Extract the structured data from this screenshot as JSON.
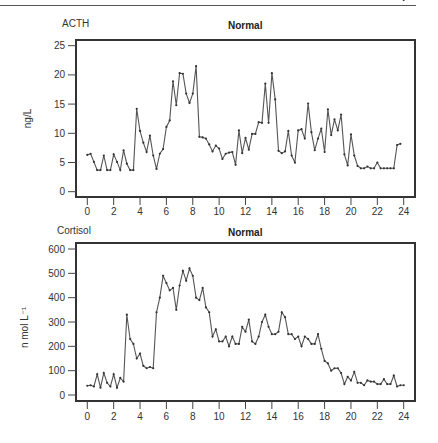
{
  "chart_data": [
    {
      "type": "line",
      "series_label": "ACTH",
      "title": "Normal",
      "xlabel": "",
      "ylabel": "ng/L",
      "xlim": [
        0,
        24
      ],
      "ylim": [
        0,
        25
      ],
      "xticks": [
        0,
        2,
        4,
        6,
        8,
        10,
        12,
        14,
        16,
        18,
        20,
        22,
        24
      ],
      "yticks": [
        0,
        5,
        10,
        15,
        20,
        25
      ],
      "grid": false,
      "legend": null,
      "x": [
        0.0,
        0.25,
        0.5,
        0.75,
        1.0,
        1.25,
        1.5,
        1.75,
        2.0,
        2.25,
        2.5,
        2.75,
        3.0,
        3.25,
        3.5,
        3.75,
        4.0,
        4.25,
        4.5,
        4.75,
        5.0,
        5.25,
        5.5,
        5.75,
        6.0,
        6.25,
        6.5,
        6.75,
        7.0,
        7.25,
        7.5,
        7.75,
        8.0,
        8.25,
        8.5,
        8.75,
        9.0,
        9.25,
        9.5,
        9.75,
        10.0,
        10.25,
        10.5,
        10.75,
        11.0,
        11.25,
        11.5,
        11.75,
        12.0,
        12.25,
        12.5,
        12.75,
        13.0,
        13.25,
        13.5,
        13.75,
        14.0,
        14.25,
        14.5,
        14.75,
        15.0,
        15.25,
        15.5,
        15.75,
        16.0,
        16.25,
        16.5,
        16.75,
        17.0,
        17.25,
        17.5,
        17.75,
        18.0,
        18.25,
        18.5,
        18.75,
        19.0,
        19.25,
        19.5,
        19.75,
        20.0,
        20.25,
        20.5,
        20.75,
        21.0,
        21.25,
        21.5,
        21.75,
        22.0,
        22.25,
        22.5,
        22.75,
        23.0,
        23.25,
        23.5,
        23.75,
        24.0
      ],
      "values": [
        6.3,
        6.5,
        5.1,
        3.7,
        3.7,
        6.2,
        3.7,
        3.7,
        6.4,
        5.1,
        3.7,
        7.1,
        4.8,
        3.7,
        3.7,
        14.2,
        10.4,
        8.4,
        6.8,
        9.6,
        6.2,
        3.9,
        6.5,
        7.3,
        11.1,
        12.2,
        18.9,
        14.8,
        20.3,
        20.2,
        16.8,
        15.2,
        16.8,
        21.5,
        9.4,
        9.3,
        9.1,
        8.1,
        6.9,
        7.9,
        7.4,
        5.6,
        6.5,
        6.7,
        6.8,
        4.6,
        10.5,
        6.6,
        9.2,
        7.2,
        9.9,
        9.9,
        11.9,
        11.8,
        18.5,
        11.8,
        20.3,
        15.8,
        7.0,
        6.6,
        6.9,
        10.4,
        6.2,
        5.0,
        10.5,
        10.7,
        9.1,
        15.1,
        10.2,
        7.1,
        9.1,
        10.8,
        6.8,
        14.1,
        9.7,
        12.4,
        10.5,
        13.2,
        6.4,
        4.5,
        9.8,
        6.2,
        4.4,
        4.0,
        4.0,
        4.3,
        4.0,
        4.0,
        5.0,
        4.0,
        4.0,
        4.0,
        4.0,
        4.0,
        8.0,
        8.2
      ]
    },
    {
      "type": "line",
      "series_label": "Cortisol",
      "title": "Normal",
      "xlabel": "",
      "ylabel": "n mol L⁻¹",
      "xlim": [
        0,
        24
      ],
      "ylim": [
        0,
        600
      ],
      "xticks": [
        0,
        2,
        4,
        6,
        8,
        10,
        12,
        14,
        16,
        18,
        20,
        22,
        24
      ],
      "yticks": [
        0,
        100,
        200,
        300,
        400,
        500,
        600
      ],
      "grid": false,
      "legend": null,
      "x": [
        0.0,
        0.25,
        0.5,
        0.75,
        1.0,
        1.25,
        1.5,
        1.75,
        2.0,
        2.25,
        2.5,
        2.75,
        3.0,
        3.25,
        3.5,
        3.75,
        4.0,
        4.25,
        4.5,
        4.75,
        5.0,
        5.25,
        5.5,
        5.75,
        6.0,
        6.25,
        6.5,
        6.75,
        7.0,
        7.25,
        7.5,
        7.75,
        8.0,
        8.25,
        8.5,
        8.75,
        9.0,
        9.25,
        9.5,
        9.75,
        10.0,
        10.25,
        10.5,
        10.75,
        11.0,
        11.25,
        11.5,
        11.75,
        12.0,
        12.25,
        12.5,
        12.75,
        13.0,
        13.25,
        13.5,
        13.75,
        14.0,
        14.25,
        14.5,
        14.75,
        15.0,
        15.25,
        15.5,
        15.75,
        16.0,
        16.25,
        16.5,
        16.75,
        17.0,
        17.25,
        17.5,
        17.75,
        18.0,
        18.25,
        18.5,
        18.75,
        19.0,
        19.25,
        19.5,
        19.75,
        20.0,
        20.25,
        20.5,
        20.75,
        21.0,
        21.25,
        21.5,
        21.75,
        22.0,
        22.25,
        22.5,
        22.75,
        23.0,
        23.25,
        23.5,
        23.75,
        24.0
      ],
      "values": [
        38,
        40,
        35,
        85,
        30,
        90,
        50,
        35,
        85,
        30,
        70,
        55,
        330,
        230,
        210,
        150,
        170,
        120,
        110,
        115,
        110,
        340,
        400,
        490,
        460,
        430,
        440,
        350,
        450,
        510,
        470,
        520,
        490,
        400,
        390,
        440,
        360,
        340,
        240,
        270,
        220,
        220,
        240,
        200,
        240,
        210,
        210,
        280,
        260,
        310,
        220,
        210,
        240,
        300,
        330,
        280,
        250,
        250,
        260,
        340,
        320,
        250,
        250,
        230,
        240,
        200,
        240,
        230,
        210,
        210,
        250,
        190,
        140,
        130,
        100,
        110,
        110,
        90,
        45,
        75,
        60,
        95,
        50,
        50,
        40,
        60,
        55,
        55,
        45,
        45,
        65,
        45,
        45,
        80,
        35,
        40,
        40
      ]
    }
  ]
}
